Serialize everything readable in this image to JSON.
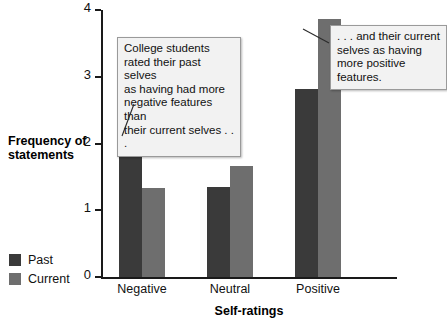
{
  "chart_data": {
    "type": "bar",
    "title": "",
    "xlabel": "Self-ratings",
    "ylabel": "Frequency of statements",
    "categories": [
      "Negative",
      "Neutral",
      "Positive"
    ],
    "series": [
      {
        "name": "Past",
        "color": "#3a3a3a",
        "values": [
          2.15,
          1.35,
          2.82
        ]
      },
      {
        "name": "Current",
        "color": "#6e6e6e",
        "values": [
          1.34,
          1.66,
          3.87
        ]
      }
    ],
    "ylim": [
      0,
      4
    ],
    "ytick_labels": [
      "0",
      "1",
      "2",
      "3",
      "4"
    ],
    "ytick_values": [
      0,
      1,
      2,
      3,
      4
    ],
    "grid": false,
    "legend_position": "bottom-left-outside",
    "annotations": [
      {
        "id": "callout-past",
        "text": "College students rated their past selves as having had more negative features than their current selves . . .",
        "points_to": "Negative / Past bar"
      },
      {
        "id": "callout-current",
        "text": ". . . and their current selves as having more positive features.",
        "points_to": "Positive / Current bar"
      }
    ]
  },
  "legend": {
    "items": [
      {
        "label": "Past",
        "color": "#3a3a3a"
      },
      {
        "label": "Current",
        "color": "#6e6e6e"
      }
    ]
  },
  "axes": {
    "y_title": "Frequency of statements",
    "x_title": "Self-ratings",
    "y_ticks": [
      "4",
      "3",
      "2",
      "1",
      "0"
    ],
    "x_categories": [
      "Negative",
      "Neutral",
      "Positive"
    ]
  },
  "callouts": {
    "past": ". . .",
    "past_lines": [
      "College students",
      "rated their past selves",
      "as having had more",
      "negative features than",
      "their current selves . . ."
    ],
    "current_lines": [
      ". . . and their current",
      "selves as having",
      "more positive features."
    ]
  },
  "colors": {
    "past": "#3a3a3a",
    "current": "#6e6e6e",
    "axis": "#1a1a1a",
    "callout_bg": "#f2f2f2",
    "callout_border": "#9a9a9a",
    "background": "#ffffff"
  }
}
